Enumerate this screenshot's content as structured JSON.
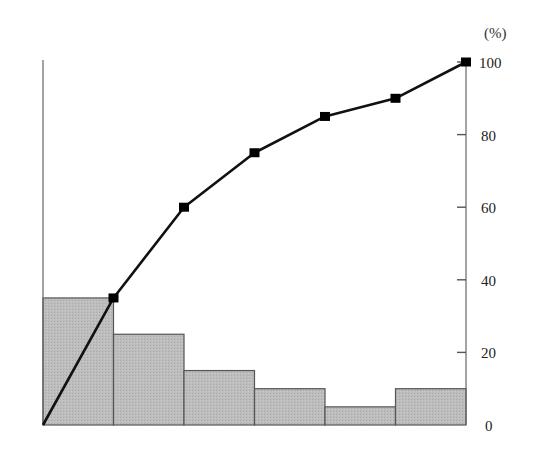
{
  "chart_data": {
    "type": "bar",
    "subtype": "pareto",
    "title": "",
    "xlabel": "",
    "ylabel": "",
    "categories": [
      "1",
      "2",
      "3",
      "4",
      "5",
      "6"
    ],
    "series": [
      {
        "name": "frequency",
        "type": "bar",
        "values": [
          35,
          25,
          15,
          10,
          5,
          10
        ]
      },
      {
        "name": "cumulative",
        "type": "line",
        "x_start": 0,
        "values": [
          35,
          60,
          75,
          85,
          90,
          100
        ]
      }
    ],
    "right_axis": {
      "unit_label": "(%)",
      "ticks": [
        0,
        20,
        40,
        60,
        80,
        100
      ],
      "ylim": [
        0,
        100
      ]
    },
    "grid": false,
    "legend": null
  },
  "colors": {
    "bar_fill": "#b8b8b8",
    "bar_stroke": "#555555",
    "line": "#111111",
    "marker": "#000000",
    "axis": "#555555"
  }
}
